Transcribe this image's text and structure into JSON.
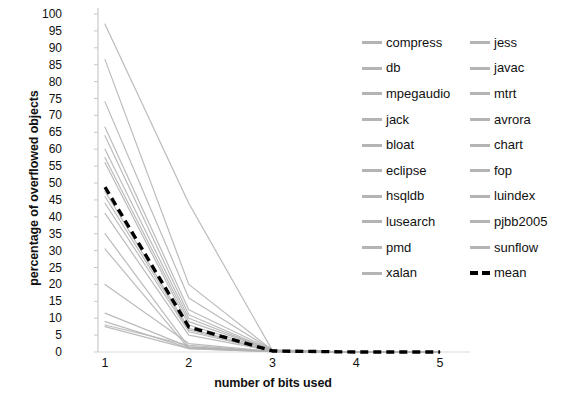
{
  "chart_data": {
    "type": "line",
    "title": "",
    "xlabel": "number of bits used",
    "ylabel": "percentage of overflowed objects",
    "x": [
      1,
      2,
      3,
      4,
      5
    ],
    "xlim": [
      1,
      5
    ],
    "ylim": [
      0,
      100
    ],
    "ytick_labels": [
      "100",
      "95",
      "90",
      "85",
      "80",
      "75",
      "70",
      "65",
      "60",
      "55",
      "50",
      "45",
      "40",
      "35",
      "30",
      "25",
      "20",
      "15",
      "10",
      "5",
      "0"
    ],
    "ytick_values": [
      100,
      95,
      90,
      85,
      80,
      75,
      70,
      65,
      60,
      55,
      50,
      45,
      40,
      35,
      30,
      25,
      20,
      15,
      10,
      5,
      0
    ],
    "xtick_labels": [
      "1",
      "2",
      "3",
      "4",
      "5"
    ],
    "grid": false,
    "legend_position": "right",
    "series_color": "#b4b4b4",
    "mean_color": "#000000",
    "series": [
      {
        "name": "compress",
        "values": [
          35.0,
          1.5,
          0.2,
          0.0,
          0.0
        ]
      },
      {
        "name": "jess",
        "values": [
          57.5,
          9.0,
          0.5,
          0.0,
          0.0
        ]
      },
      {
        "name": "db",
        "values": [
          30.5,
          1.0,
          0.1,
          0.0,
          0.0
        ]
      },
      {
        "name": "javac",
        "values": [
          66.5,
          12.5,
          0.6,
          0.0,
          0.0
        ]
      },
      {
        "name": "mpegaudio",
        "values": [
          8.0,
          2.0,
          0.1,
          0.0,
          0.0
        ]
      },
      {
        "name": "mtrt",
        "values": [
          60.0,
          10.0,
          0.4,
          0.0,
          0.0
        ]
      },
      {
        "name": "jack",
        "values": [
          44.0,
          6.0,
          0.3,
          0.0,
          0.0
        ]
      },
      {
        "name": "avrora",
        "values": [
          97.0,
          44.0,
          0.4,
          0.0,
          0.0
        ]
      },
      {
        "name": "bloat",
        "values": [
          46.0,
          6.5,
          0.3,
          0.0,
          0.0
        ]
      },
      {
        "name": "chart",
        "values": [
          86.5,
          20.0,
          0.5,
          0.0,
          0.0
        ]
      },
      {
        "name": "eclipse",
        "values": [
          41.0,
          5.0,
          0.3,
          0.0,
          0.0
        ]
      },
      {
        "name": "fop",
        "values": [
          56.0,
          8.0,
          0.4,
          0.0,
          0.0
        ]
      },
      {
        "name": "hsqldb",
        "values": [
          20.0,
          2.5,
          0.2,
          0.0,
          0.0
        ]
      },
      {
        "name": "luindex",
        "values": [
          74.0,
          16.0,
          0.5,
          0.0,
          0.0
        ]
      },
      {
        "name": "lusearch",
        "values": [
          11.5,
          1.5,
          0.1,
          0.0,
          0.0
        ]
      },
      {
        "name": "pjbb2005",
        "values": [
          64.0,
          11.0,
          0.4,
          0.0,
          0.0
        ]
      },
      {
        "name": "pmd",
        "values": [
          9.0,
          1.2,
          0.1,
          0.0,
          0.0
        ]
      },
      {
        "name": "sunflow",
        "values": [
          47.5,
          7.0,
          0.3,
          0.0,
          0.0
        ]
      },
      {
        "name": "xalan",
        "values": [
          7.5,
          1.0,
          0.1,
          0.0,
          0.0
        ]
      }
    ],
    "mean_series": {
      "name": "mean",
      "values": [
        48.8,
        7.4,
        0.3,
        0.0,
        0.0
      ]
    }
  },
  "legend": {
    "entries": [
      {
        "label": "compress",
        "style": "solid"
      },
      {
        "label": "jess",
        "style": "solid"
      },
      {
        "label": "db",
        "style": "solid"
      },
      {
        "label": "javac",
        "style": "solid"
      },
      {
        "label": "mpegaudio",
        "style": "solid"
      },
      {
        "label": "mtrt",
        "style": "solid"
      },
      {
        "label": "jack",
        "style": "solid"
      },
      {
        "label": "avrora",
        "style": "solid"
      },
      {
        "label": "bloat",
        "style": "solid"
      },
      {
        "label": "chart",
        "style": "solid"
      },
      {
        "label": "eclipse",
        "style": "solid"
      },
      {
        "label": "fop",
        "style": "solid"
      },
      {
        "label": "hsqldb",
        "style": "solid"
      },
      {
        "label": "luindex",
        "style": "solid"
      },
      {
        "label": "lusearch",
        "style": "solid"
      },
      {
        "label": "pjbb2005",
        "style": "solid"
      },
      {
        "label": "pmd",
        "style": "solid"
      },
      {
        "label": "sunflow",
        "style": "solid"
      },
      {
        "label": "xalan",
        "style": "solid"
      },
      {
        "label": "mean",
        "style": "dashed"
      }
    ]
  }
}
